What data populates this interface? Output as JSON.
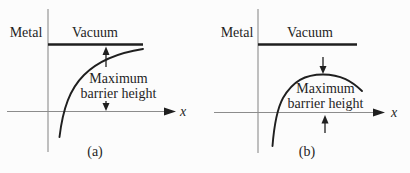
{
  "figure": {
    "colors": {
      "background": "#fcfcfc",
      "ink": "#1f1f1f",
      "axis": "#8c8c8c"
    },
    "panels": [
      {
        "metal_label": "Metal",
        "vacuum_label": "Vacuum",
        "annotation": {
          "line1": "Maximum",
          "line2": "barrier height"
        },
        "x_axis_label": "x",
        "caption": "(a)"
      },
      {
        "metal_label": "Metal",
        "vacuum_label": "Vacuum",
        "annotation": {
          "line1": "Maximum",
          "line2": "barrier height"
        },
        "x_axis_label": "x",
        "caption": "(b)"
      }
    ]
  }
}
